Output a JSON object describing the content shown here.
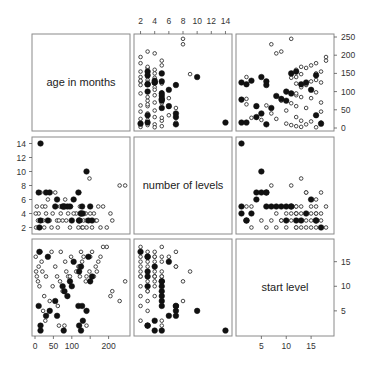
{
  "chart_data": {
    "type": "scatter",
    "title": "",
    "layout": "scatterplot-matrix",
    "variables": [
      {
        "name": "age",
        "label": "age in months",
        "range": [
          0,
          250
        ],
        "ticks": [
          0,
          50,
          100,
          150,
          200
        ]
      },
      {
        "name": "levels",
        "label": "number of levels",
        "range": [
          1.5,
          14.5
        ],
        "ticks": [
          2,
          4,
          6,
          8,
          10,
          12,
          14
        ]
      },
      {
        "name": "start",
        "label": "start level",
        "range": [
          0.5,
          19
        ],
        "ticks": [
          5,
          10,
          15
        ]
      }
    ],
    "axes": {
      "top": {
        "variable": "levels",
        "labels": [
          "2",
          "4",
          "6",
          "8",
          "10",
          "12",
          "14"
        ]
      },
      "right_row1": {
        "variable": "age",
        "labels": [
          "0",
          "50",
          "100",
          "150",
          "200",
          "250"
        ]
      },
      "left_row2": {
        "variable": "levels",
        "labels": [
          "2",
          "4",
          "6",
          "8",
          "10",
          "12",
          "14"
        ]
      },
      "right_row3": {
        "variable": "start",
        "labels": [
          "5",
          "10",
          "15"
        ]
      },
      "bottom_col1": {
        "variable": "age",
        "labels": [
          "0",
          "50",
          "100",
          "200"
        ]
      },
      "bottom_col3": {
        "variable": "start",
        "labels": [
          "5",
          "10",
          "15"
        ]
      }
    },
    "legend": "none",
    "grid": false,
    "series": [
      {
        "name": "open",
        "marker": "open-circle",
        "points": [
          {
            "age": 245,
            "levels": 8,
            "start": 11
          },
          {
            "age": 205,
            "levels": 4,
            "start": 8
          },
          {
            "age": 195,
            "levels": 2,
            "start": 18
          },
          {
            "age": 178,
            "levels": 2,
            "start": 16
          },
          {
            "age": 172,
            "levels": 5,
            "start": 15
          },
          {
            "age": 165,
            "levels": 3,
            "start": 14
          },
          {
            "age": 160,
            "levels": 4,
            "start": 12
          },
          {
            "age": 155,
            "levels": 2,
            "start": 17
          },
          {
            "age": 148,
            "levels": 9,
            "start": 13
          },
          {
            "age": 138,
            "levels": 4,
            "start": 11
          },
          {
            "age": 132,
            "levels": 3,
            "start": 16
          },
          {
            "age": 128,
            "levels": 2,
            "start": 15
          },
          {
            "age": 122,
            "levels": 5,
            "start": 12
          },
          {
            "age": 118,
            "levels": 2,
            "start": 14
          },
          {
            "age": 112,
            "levels": 4,
            "start": 13
          },
          {
            "age": 98,
            "levels": 5,
            "start": 16
          },
          {
            "age": 90,
            "levels": 4,
            "start": 12
          },
          {
            "age": 82,
            "levels": 6,
            "start": 15
          },
          {
            "age": 75,
            "levels": 3,
            "start": 9
          },
          {
            "age": 68,
            "levels": 5,
            "start": 11
          },
          {
            "age": 62,
            "levels": 2,
            "start": 6
          },
          {
            "age": 55,
            "levels": 7,
            "start": 14
          },
          {
            "age": 48,
            "levels": 4,
            "start": 10
          },
          {
            "age": 40,
            "levels": 3,
            "start": 7
          },
          {
            "age": 35,
            "levels": 6,
            "start": 16
          },
          {
            "age": 30,
            "levels": 4,
            "start": 12
          },
          {
            "age": 25,
            "levels": 2,
            "start": 8
          },
          {
            "age": 20,
            "levels": 5,
            "start": 13
          },
          {
            "age": 18,
            "levels": 3,
            "start": 15
          },
          {
            "age": 12,
            "levels": 2,
            "start": 10
          },
          {
            "age": 10,
            "levels": 4,
            "start": 14
          },
          {
            "age": 8,
            "levels": 3,
            "start": 11
          },
          {
            "age": 5,
            "levels": 5,
            "start": 12
          },
          {
            "age": 3,
            "levels": 2,
            "start": 13
          },
          {
            "age": 2,
            "levels": 4,
            "start": 16
          },
          {
            "age": 15,
            "levels": 7,
            "start": 17
          },
          {
            "age": 22,
            "levels": 3,
            "start": 5
          },
          {
            "age": 28,
            "levels": 5,
            "start": 3
          },
          {
            "age": 45,
            "levels": 2,
            "start": 17
          },
          {
            "age": 60,
            "levels": 3,
            "start": 12
          },
          {
            "age": 70,
            "levels": 4,
            "start": 17
          },
          {
            "age": 85,
            "levels": 3,
            "start": 13
          },
          {
            "age": 95,
            "levels": 2,
            "start": 12
          },
          {
            "age": 105,
            "levels": 4,
            "start": 15
          },
          {
            "age": 125,
            "levels": 3,
            "start": 17
          },
          {
            "age": 140,
            "levels": 2,
            "start": 12
          },
          {
            "age": 150,
            "levels": 4,
            "start": 16
          },
          {
            "age": 168,
            "levels": 3,
            "start": 13
          },
          {
            "age": 185,
            "levels": 5,
            "start": 18
          },
          {
            "age": 120,
            "levels": 7,
            "start": 14
          },
          {
            "age": 80,
            "levels": 5,
            "start": 2
          },
          {
            "age": 65,
            "levels": 3,
            "start": 2
          },
          {
            "age": 130,
            "levels": 2,
            "start": 3
          },
          {
            "age": 140,
            "levels": 3,
            "start": 2
          },
          {
            "age": 210,
            "levels": 3,
            "start": 9
          },
          {
            "age": 230,
            "levels": 8,
            "start": 7
          }
        ]
      },
      {
        "name": "filled",
        "marker": "filled-circle",
        "points": [
          {
            "age": 140,
            "levels": 10,
            "start": 5
          },
          {
            "age": 15,
            "levels": 14,
            "start": 1
          },
          {
            "age": 155,
            "levels": 3,
            "start": 12
          },
          {
            "age": 145,
            "levels": 3,
            "start": 16
          },
          {
            "age": 125,
            "levels": 4,
            "start": 14
          },
          {
            "age": 120,
            "levels": 3,
            "start": 13
          },
          {
            "age": 118,
            "levels": 7,
            "start": 6
          },
          {
            "age": 105,
            "levels": 6,
            "start": 15
          },
          {
            "age": 100,
            "levels": 3,
            "start": 10
          },
          {
            "age": 95,
            "levels": 5,
            "start": 11
          },
          {
            "age": 88,
            "levels": 5,
            "start": 8
          },
          {
            "age": 80,
            "levels": 5,
            "start": 9
          },
          {
            "age": 75,
            "levels": 5,
            "start": 10
          },
          {
            "age": 60,
            "levels": 6,
            "start": 4
          },
          {
            "age": 55,
            "levels": 5,
            "start": 7
          },
          {
            "age": 40,
            "levels": 7,
            "start": 5
          },
          {
            "age": 35,
            "levels": 3,
            "start": 16
          },
          {
            "age": 30,
            "levels": 7,
            "start": 4
          },
          {
            "age": 15,
            "levels": 3,
            "start": 2
          },
          {
            "age": 10,
            "levels": 7,
            "start": 6
          },
          {
            "age": 12,
            "levels": 2,
            "start": 17
          },
          {
            "age": 130,
            "levels": 4,
            "start": 3
          },
          {
            "age": 128,
            "levels": 5,
            "start": 6
          },
          {
            "age": 150,
            "levels": 5,
            "start": 11
          },
          {
            "age": 78,
            "levels": 5,
            "start": 1
          },
          {
            "age": 120,
            "levels": 3,
            "start": 2
          },
          {
            "age": 125,
            "levels": 4,
            "start": 1
          }
        ]
      }
    ]
  }
}
